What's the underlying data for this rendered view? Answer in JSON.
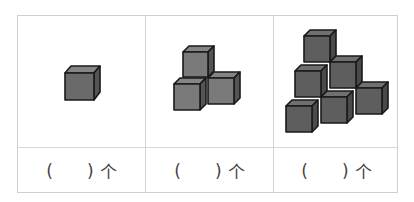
{
  "columns": [
    {
      "cube_count_shown": 1,
      "answer": {
        "open": "(",
        "blank": "",
        "close": ")",
        "unit": "个"
      }
    },
    {
      "cube_count_shown": 4,
      "answer": {
        "open": "(",
        "blank": "",
        "close": ")",
        "unit": "个"
      }
    },
    {
      "cube_count_shown": 8,
      "answer": {
        "open": "(",
        "blank": "",
        "close": ")",
        "unit": "个"
      }
    }
  ],
  "colors": {
    "cube_face": "#6a6a6a",
    "cube_top": "#858585",
    "cube_side": "#555555",
    "edge": "#1a1a1a"
  }
}
